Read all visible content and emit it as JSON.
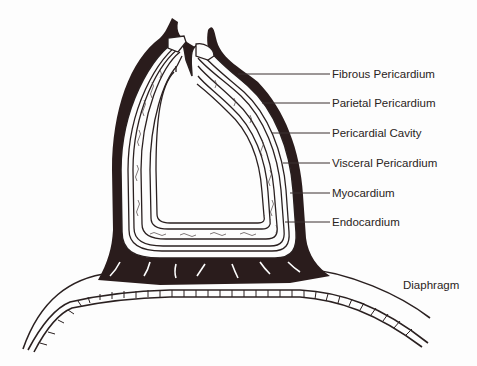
{
  "diagram": {
    "colors": {
      "ink": "#2a1c1c",
      "line": "#3a3030",
      "background": "#fdfdfd"
    },
    "labels": [
      {
        "id": "fibrous-pericardium",
        "text": "Fibrous Pericardium",
        "x": 332,
        "y": 68
      },
      {
        "id": "parietal-pericardium",
        "text": "Parietal Pericardium",
        "x": 332,
        "y": 97
      },
      {
        "id": "pericardial-cavity",
        "text": "Pericardial Cavity",
        "x": 332,
        "y": 126
      },
      {
        "id": "visceral-pericardium",
        "text": "Visceral Pericardium",
        "x": 332,
        "y": 156
      },
      {
        "id": "myocardium",
        "text": "Myocardium",
        "x": 332,
        "y": 189
      },
      {
        "id": "endocardium",
        "text": "Endocardium",
        "x": 332,
        "y": 217
      },
      {
        "id": "diaphragm",
        "text": "Diaphragm",
        "x": 403,
        "y": 279
      }
    ]
  }
}
